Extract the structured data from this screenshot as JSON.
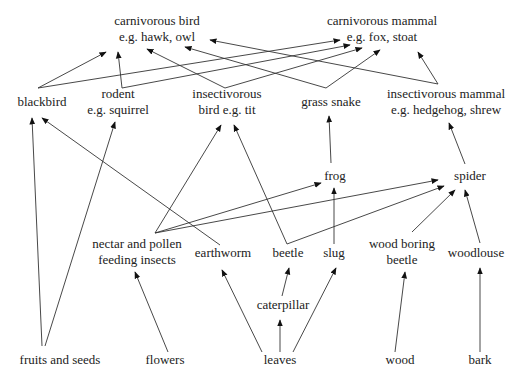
{
  "diagram": {
    "nodes": [
      {
        "id": "carnivorous_bird",
        "lines": [
          "carnivorous bird",
          "e.g. hawk, owl"
        ],
        "x": 157,
        "y": 25
      },
      {
        "id": "carnivorous_mammal",
        "lines": [
          "carnivorous mammal",
          "e.g. fox, stoat"
        ],
        "x": 382,
        "y": 25
      },
      {
        "id": "blackbird",
        "lines": [
          "blackbird"
        ],
        "x": 42,
        "y": 106
      },
      {
        "id": "rodent",
        "lines": [
          "rodent",
          "e.g. squirrel"
        ],
        "x": 118,
        "y": 98
      },
      {
        "id": "insectivorous_bird",
        "lines": [
          "insectivorous",
          "bird e.g. tit"
        ],
        "x": 227,
        "y": 98
      },
      {
        "id": "grass_snake",
        "lines": [
          "grass snake"
        ],
        "x": 331,
        "y": 106
      },
      {
        "id": "insectivorous_mammal",
        "lines": [
          "insectivorous mammal",
          "e.g. hedgehog, shrew"
        ],
        "x": 446,
        "y": 98
      },
      {
        "id": "frog",
        "lines": [
          "frog"
        ],
        "x": 335,
        "y": 180
      },
      {
        "id": "spider",
        "lines": [
          "spider"
        ],
        "x": 470,
        "y": 180
      },
      {
        "id": "nectar_insects",
        "lines": [
          "nectar and pollen",
          "feeding insects"
        ],
        "x": 137,
        "y": 248
      },
      {
        "id": "earthworm",
        "lines": [
          "earthworm"
        ],
        "x": 223,
        "y": 257
      },
      {
        "id": "beetle",
        "lines": [
          "beetle"
        ],
        "x": 288,
        "y": 257
      },
      {
        "id": "slug",
        "lines": [
          "slug"
        ],
        "x": 334,
        "y": 257
      },
      {
        "id": "wood_boring_beetle",
        "lines": [
          "wood boring",
          "beetle"
        ],
        "x": 402,
        "y": 248
      },
      {
        "id": "woodlouse",
        "lines": [
          "woodlouse"
        ],
        "x": 476,
        "y": 257
      },
      {
        "id": "caterpillar",
        "lines": [
          "caterpillar"
        ],
        "x": 283,
        "y": 309
      },
      {
        "id": "fruits_seeds",
        "lines": [
          "fruits and seeds"
        ],
        "x": 60,
        "y": 364
      },
      {
        "id": "flowers",
        "lines": [
          "flowers"
        ],
        "x": 165,
        "y": 364
      },
      {
        "id": "leaves",
        "lines": [
          "leaves"
        ],
        "x": 280,
        "y": 364
      },
      {
        "id": "wood",
        "lines": [
          "wood"
        ],
        "x": 400,
        "y": 364
      },
      {
        "id": "bark",
        "lines": [
          "bark"
        ],
        "x": 480,
        "y": 364
      }
    ],
    "edges": [
      {
        "from": "blackbird",
        "to": "carnivorous_bird",
        "x1": 38,
        "y1": 88,
        "x2": 106,
        "y2": 52
      },
      {
        "from": "blackbird",
        "to": "carnivorous_mammal",
        "x1": 38,
        "y1": 88,
        "x2": 340,
        "y2": 40
      },
      {
        "from": "rodent",
        "to": "carnivorous_bird",
        "x1": 122,
        "y1": 88,
        "x2": 118,
        "y2": 52
      },
      {
        "from": "rodent",
        "to": "carnivorous_mammal",
        "x1": 122,
        "y1": 88,
        "x2": 350,
        "y2": 45
      },
      {
        "from": "insectivorous_bird",
        "to": "carnivorous_bird",
        "x1": 225,
        "y1": 88,
        "x2": 147,
        "y2": 49
      },
      {
        "from": "insectivorous_bird",
        "to": "carnivorous_mammal",
        "x1": 225,
        "y1": 88,
        "x2": 362,
        "y2": 48
      },
      {
        "from": "grass_snake",
        "to": "carnivorous_bird",
        "x1": 326,
        "y1": 88,
        "x2": 185,
        "y2": 47
      },
      {
        "from": "grass_snake",
        "to": "carnivorous_mammal",
        "x1": 326,
        "y1": 88,
        "x2": 380,
        "y2": 50
      },
      {
        "from": "insectivorous_mammal",
        "to": "carnivorous_bird",
        "x1": 438,
        "y1": 84,
        "x2": 210,
        "y2": 40
      },
      {
        "from": "insectivorous_mammal",
        "to": "carnivorous_mammal",
        "x1": 438,
        "y1": 84,
        "x2": 418,
        "y2": 52
      },
      {
        "from": "frog",
        "to": "grass_snake",
        "x1": 331,
        "y1": 163,
        "x2": 329,
        "y2": 116
      },
      {
        "from": "spider",
        "to": "insectivorous_mammal",
        "x1": 465,
        "y1": 164,
        "x2": 449,
        "y2": 123
      },
      {
        "from": "fruits_seeds",
        "to": "blackbird",
        "x1": 42,
        "y1": 346,
        "x2": 32,
        "y2": 118
      },
      {
        "from": "fruits_seeds",
        "to": "rodent",
        "x1": 45,
        "y1": 346,
        "x2": 115,
        "y2": 122
      },
      {
        "from": "earthworm",
        "to": "blackbird",
        "x1": 220,
        "y1": 245,
        "x2": 42,
        "y2": 118
      },
      {
        "from": "nectar_insects",
        "to": "insectivorous_bird",
        "x1": 155,
        "y1": 233,
        "x2": 221,
        "y2": 125
      },
      {
        "from": "beetle",
        "to": "insectivorous_bird",
        "x1": 287,
        "y1": 244,
        "x2": 234,
        "y2": 125
      },
      {
        "from": "nectar_insects",
        "to": "frog",
        "x1": 155,
        "y1": 233,
        "x2": 321,
        "y2": 183
      },
      {
        "from": "nectar_insects",
        "to": "spider",
        "x1": 155,
        "y1": 233,
        "x2": 438,
        "y2": 180
      },
      {
        "from": "beetle",
        "to": "spider",
        "x1": 287,
        "y1": 244,
        "x2": 444,
        "y2": 186
      },
      {
        "from": "slug",
        "to": "frog",
        "x1": 334,
        "y1": 244,
        "x2": 334,
        "y2": 188
      },
      {
        "from": "wood_boring_beetle",
        "to": "spider",
        "x1": 412,
        "y1": 232,
        "x2": 455,
        "y2": 190
      },
      {
        "from": "woodlouse",
        "to": "spider",
        "x1": 480,
        "y1": 243,
        "x2": 465,
        "y2": 190
      },
      {
        "from": "flowers",
        "to": "nectar_insects",
        "x1": 168,
        "y1": 352,
        "x2": 135,
        "y2": 272
      },
      {
        "from": "leaves",
        "to": "earthworm",
        "x1": 262,
        "y1": 352,
        "x2": 222,
        "y2": 270
      },
      {
        "from": "caterpillar",
        "to": "beetle",
        "x1": 282,
        "y1": 296,
        "x2": 289,
        "y2": 268
      },
      {
        "from": "leaves",
        "to": "caterpillar",
        "x1": 280,
        "y1": 352,
        "x2": 280,
        "y2": 320
      },
      {
        "from": "leaves",
        "to": "slug",
        "x1": 293,
        "y1": 352,
        "x2": 336,
        "y2": 268
      },
      {
        "from": "wood",
        "to": "wood_boring_beetle",
        "x1": 395,
        "y1": 352,
        "x2": 405,
        "y2": 272
      },
      {
        "from": "bark",
        "to": "woodlouse",
        "x1": 480,
        "y1": 352,
        "x2": 480,
        "y2": 268
      }
    ]
  }
}
